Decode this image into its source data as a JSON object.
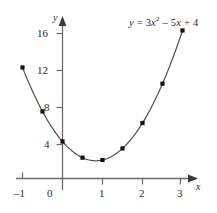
{
  "chart_data": {
    "type": "scatter",
    "title": "",
    "equation": "y = 3x^2 - 5x + 4",
    "equation_parts": {
      "lhs": "y",
      "equals": "=",
      "coef_quad": "3",
      "var_quad": "x",
      "exponent": "2",
      "minus": "–",
      "coef_lin": "5",
      "var_lin": "x",
      "plus": "+",
      "constant": "4"
    },
    "xlabel": "x",
    "ylabel": "y",
    "x": [
      -1,
      -0.5,
      0,
      0.5,
      1,
      1.5,
      2,
      2.5,
      3
    ],
    "values": [
      12,
      7.25,
      4,
      2.25,
      2,
      3.25,
      6,
      10.25,
      16
    ],
    "series": [
      {
        "name": "y = 3x² – 5x + 4",
        "points": [
          {
            "x": -1,
            "y": 12
          },
          {
            "x": -0.5,
            "y": 7.25
          },
          {
            "x": 0,
            "y": 4
          },
          {
            "x": 0.5,
            "y": 2.25
          },
          {
            "x": 1,
            "y": 2
          },
          {
            "x": 1.5,
            "y": 3.25
          },
          {
            "x": 2,
            "y": 6
          },
          {
            "x": 2.5,
            "y": 10.25
          },
          {
            "x": 3,
            "y": 16
          }
        ]
      }
    ],
    "xlim": [
      -1.25,
      3.45
    ],
    "ylim": [
      0,
      17.5
    ],
    "xticks": [
      -1,
      0,
      1,
      2,
      3
    ],
    "xtick_labels": [
      "–1",
      "0",
      "1",
      "2",
      "3"
    ],
    "yticks": [
      4,
      8,
      12,
      16
    ],
    "ytick_labels": [
      "4",
      "8",
      "12",
      "16"
    ],
    "grid": false,
    "legend": "none",
    "curve_color": "#555555",
    "point_color": "#111111",
    "axis_color": "#6b6b6b",
    "text_color": "#2b2b2b"
  },
  "axes": {
    "x_axis_name": "x",
    "y_axis_name": "y"
  }
}
